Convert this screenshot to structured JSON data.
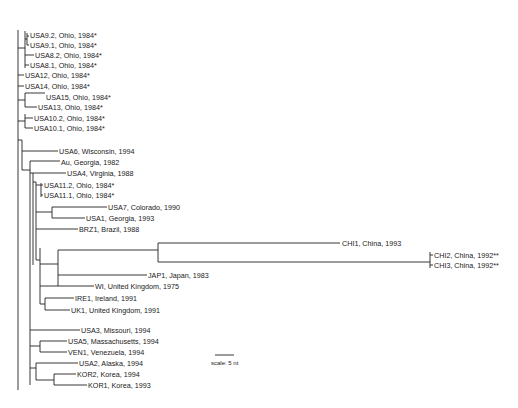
{
  "tree": {
    "leaves": [
      {
        "id": "USA9.2",
        "label": "USA9.2, Ohio, 1984*",
        "x": 29,
        "y": 35
      },
      {
        "id": "USA9.1",
        "label": "USA9.1, Ohio, 1984*",
        "x": 29,
        "y": 45
      },
      {
        "id": "USA8.2",
        "label": "USA8.2, Ohio, 1984*",
        "x": 34,
        "y": 55
      },
      {
        "id": "USA8.1",
        "label": "USA8.1, Ohio, 1984*",
        "x": 29,
        "y": 65
      },
      {
        "id": "USA12",
        "label": "USA12, Ohio, 1984*",
        "x": 25,
        "y": 75
      },
      {
        "id": "USA14",
        "label": "USA14, Ohio, 1984*",
        "x": 25,
        "y": 86
      },
      {
        "id": "USA15",
        "label": "USA15, Ohio, 1984*",
        "x": 46,
        "y": 97
      },
      {
        "id": "USA13",
        "label": "USA13, Ohio, 1984*",
        "x": 38,
        "y": 107
      },
      {
        "id": "USA10.2",
        "label": "USA10.2, Ohio, 1984*",
        "x": 34,
        "y": 118
      },
      {
        "id": "USA10.1",
        "label": "USA10.1, Ohio, 1984*",
        "x": 34,
        "y": 128
      },
      {
        "id": "USA6",
        "label": "USA6, Wisconsin, 1994",
        "x": 59,
        "y": 151
      },
      {
        "id": "Au",
        "label": "Au, Georgia, 1982",
        "x": 61,
        "y": 162
      },
      {
        "id": "USA4",
        "label": "USA4, Virginia, 1988",
        "x": 67,
        "y": 173
      },
      {
        "id": "USA11.2",
        "label": "USA11.2, Ohio, 1984*",
        "x": 44,
        "y": 185
      },
      {
        "id": "USA11.1",
        "label": "USA11.1, Ohio, 1984*",
        "x": 44,
        "y": 195
      },
      {
        "id": "USA7",
        "label": "USA7, Colorado, 1990",
        "x": 108,
        "y": 207
      },
      {
        "id": "USA1",
        "label": "USA1, Georgia, 1993",
        "x": 86,
        "y": 218
      },
      {
        "id": "BRZ1",
        "label": "BRZ1, Brazil, 1988",
        "x": 79,
        "y": 229
      },
      {
        "id": "CHI1",
        "label": "CHI1, China, 1993",
        "x": 341,
        "y": 243
      },
      {
        "id": "CHI2",
        "label": "CHI2, China, 1992**",
        "x": 434,
        "y": 255
      },
      {
        "id": "CHI3",
        "label": "CHI3, China, 1992**",
        "x": 434,
        "y": 265
      },
      {
        "id": "JAP1",
        "label": "JAP1, Japan, 1983",
        "x": 148,
        "y": 275
      },
      {
        "id": "WI",
        "label": "WI, United Kingdom, 1975",
        "x": 95,
        "y": 286
      },
      {
        "id": "IRE1",
        "label": "IRE1, Ireland, 1991",
        "x": 75,
        "y": 298
      },
      {
        "id": "UK1",
        "label": "UK1, United Kingdom, 1991",
        "x": 71,
        "y": 310
      },
      {
        "id": "USA3",
        "label": "USA3, Missouri, 1994",
        "x": 81,
        "y": 330
      },
      {
        "id": "USA5",
        "label": "USA5, Massachusetts, 1994",
        "x": 68,
        "y": 341
      },
      {
        "id": "VEN1",
        "label": "VEN1, Venezuela, 1994",
        "x": 68,
        "y": 352
      },
      {
        "id": "USA2",
        "label": "USA2, Alaska, 1994",
        "x": 79,
        "y": 363
      },
      {
        "id": "KOR2",
        "label": "KOR2, Korea, 1994",
        "x": 77,
        "y": 374
      },
      {
        "id": "KOR1",
        "label": "KOR1, Korea, 1993",
        "x": 88,
        "y": 385
      }
    ],
    "scale_bar": {
      "label": "scale: 5 nt",
      "x1": 215,
      "x2": 234,
      "y": 355
    }
  }
}
